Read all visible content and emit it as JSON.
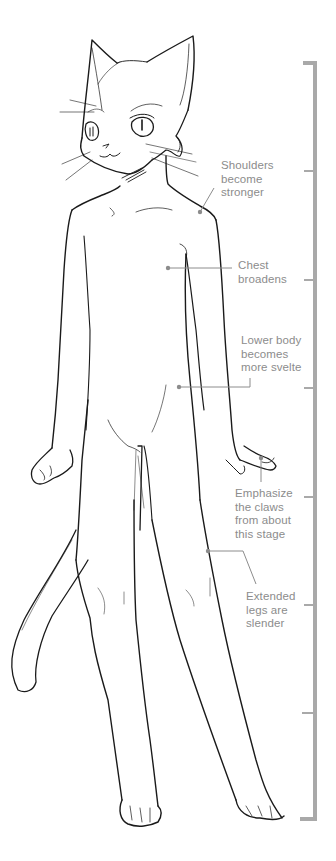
{
  "figure": {
    "line_color": "#1a1a1a",
    "annotation_color": "#8c8c8c",
    "ruler_color": "#a9a9a9"
  },
  "annotations": [
    {
      "id": "shoulders",
      "text": "Shoulders\nbecome\nstronger"
    },
    {
      "id": "chest",
      "text": "Chest\nbroadens"
    },
    {
      "id": "lower-body",
      "text": "Lower body\nbecomes\nmore svelte"
    },
    {
      "id": "claws",
      "text": "Emphasize\nthe claws\nfrom about\nthis stage"
    },
    {
      "id": "legs",
      "text": "Extended\nlegs are\nslender"
    }
  ],
  "ruler": {
    "segments": 7,
    "tick_count": 6
  }
}
